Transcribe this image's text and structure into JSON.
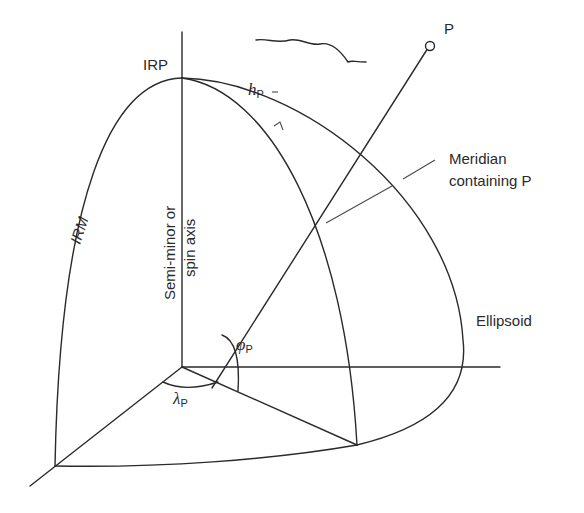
{
  "diagram": {
    "labels": {
      "point": "P",
      "irp": "IRP",
      "irm": "IRM",
      "height_symbol": "h",
      "height_subscript": "P",
      "axis_line1": "Semi-minor or",
      "axis_line2": "spin axis",
      "meridian_line1": "Meridian",
      "meridian_line2": "containing P",
      "ellipsoid": "Ellipsoid",
      "latitude_symbol": "φ",
      "latitude_subscript": "P",
      "longitude_symbol": "λ",
      "longitude_subscript": "P"
    },
    "colors": {
      "line": "#2a2a2a",
      "background": "#ffffff"
    }
  }
}
